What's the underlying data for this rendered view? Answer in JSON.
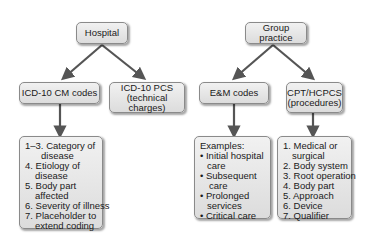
{
  "hospital": {
    "title": "Hospital",
    "cm": {
      "title": "ICD-10 CM codes",
      "items": [
        [
          "1–3. Category of",
          "disease"
        ],
        [
          "4. Etiology of",
          "disease"
        ],
        [
          "5. Body part",
          "affected"
        ],
        [
          "6. Severity of illness"
        ],
        [
          "7. Placeholder to",
          "extend coding"
        ]
      ]
    },
    "pcs": {
      "title_line1": "ICD-10 PCS",
      "title_line2": "(technical charges)"
    }
  },
  "group": {
    "title": "Group practice",
    "em": {
      "title": "E&M codes",
      "examples_label": "Examples:",
      "items": [
        [
          "• Initial hospital",
          "care"
        ],
        [
          "• Subsequent",
          "care"
        ],
        [
          "• Prolonged",
          "services"
        ],
        [
          "• Critical care"
        ]
      ]
    },
    "cpt": {
      "title_line1": "CPT/HCPCS",
      "title_line2": "(procedures)",
      "items": [
        [
          "1. Medical or",
          "surgical"
        ],
        [
          "2. Body system"
        ],
        [
          "3. Root operation"
        ],
        [
          "4. Body part"
        ],
        [
          "5. Approach"
        ],
        [
          "6. Device"
        ],
        [
          "7. Qualifier"
        ]
      ]
    }
  },
  "colors": {
    "box_fill": "#e6e6e6",
    "box_border": "#8a8a8a",
    "arrow": "#555555"
  }
}
